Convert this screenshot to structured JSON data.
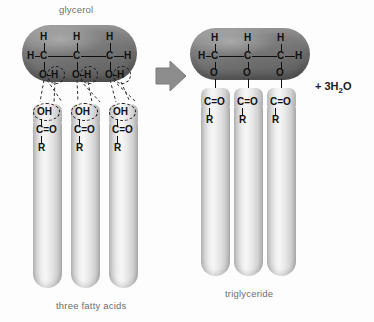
{
  "diagram": {
    "title_left": "glycerol",
    "label_reactants": "three fatty acids",
    "label_product": "triglyceride",
    "byproduct": "+ 3H",
    "byproduct_sub": "2",
    "byproduct_tail": "O",
    "arrow_icon": "right-arrow-icon"
  },
  "reactant_glycerol": {
    "name": "glycerol",
    "top_hydrogens": [
      "H",
      "H",
      "H"
    ],
    "left_hydrogen": "H",
    "right_hydrogen": "H",
    "carbons": [
      "C",
      "C",
      "C"
    ],
    "oxygens": [
      "O",
      "O",
      "O"
    ],
    "hydroxyl_hydrogens": [
      "H",
      "H",
      "H"
    ]
  },
  "reactant_fatty_acids": [
    {
      "hydroxyl": "OH",
      "carbonyl": "C=O",
      "chain": "R"
    },
    {
      "hydroxyl": "OH",
      "carbonyl": "C=O",
      "chain": "R"
    },
    {
      "hydroxyl": "OH",
      "carbonyl": "C=O",
      "chain": "R"
    }
  ],
  "product_glycerol": {
    "top_hydrogens": [
      "H",
      "H",
      "H"
    ],
    "left_hydrogen": "H",
    "right_hydrogen": "H",
    "carbons": [
      "C",
      "C",
      "C"
    ],
    "ester_oxygens": [
      "O",
      "O",
      "O"
    ]
  },
  "product_chains": [
    {
      "carbonyl": "C=O",
      "chain": "R"
    },
    {
      "carbonyl": "C=O",
      "chain": "R"
    },
    {
      "carbonyl": "C=O",
      "chain": "R"
    }
  ],
  "colors": {
    "glycerol_capsule": "#7a7a7a",
    "tail_capsule": "#e6e6e6",
    "arrow": "#8d8d8d",
    "label_text": "#6d6d6d",
    "atom_text": "#111111"
  }
}
